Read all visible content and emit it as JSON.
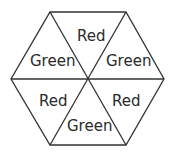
{
  "diagram": {
    "shape": "hexagon divided into 6 triangles",
    "triangles": [
      {
        "position": "top",
        "label": "Red"
      },
      {
        "position": "upper-right",
        "label": "Green"
      },
      {
        "position": "lower-right",
        "label": "Red"
      },
      {
        "position": "bottom",
        "label": "Green"
      },
      {
        "position": "lower-left",
        "label": "Red"
      },
      {
        "position": "upper-left",
        "label": "Green"
      }
    ],
    "colors": {
      "stroke": "#333333",
      "text": "#2a2a2a",
      "background": "#ffffff"
    }
  }
}
